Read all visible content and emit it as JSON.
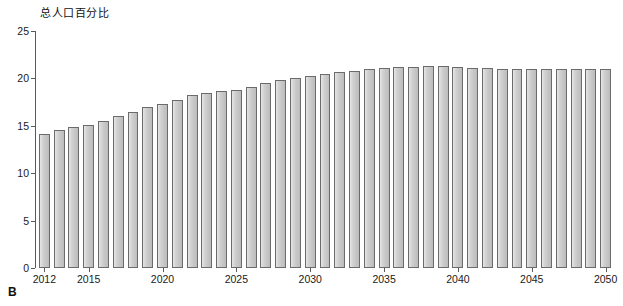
{
  "chart_data": {
    "type": "bar",
    "title": "总人口百分比",
    "panel_label": "B",
    "xlabel": "",
    "ylabel": "",
    "ylim": [
      0,
      25
    ],
    "yticks": [
      0,
      5,
      10,
      15,
      20,
      25
    ],
    "ytick_labels": [
      "0",
      "5",
      "10",
      "15",
      "20",
      "25"
    ],
    "xtick_labels": [
      "2012",
      "2015",
      "2020",
      "2025",
      "2030",
      "2035",
      "2040",
      "2045",
      "2050"
    ],
    "grid": false,
    "legend": "none",
    "bar_color": "#c6c6c6",
    "bar_edge_color": "#6b6b6b",
    "axis_color": "#5a5a5a",
    "categories": [
      "2012",
      "2013",
      "2014",
      "2015",
      "2016",
      "2017",
      "2018",
      "2019",
      "2020",
      "2021",
      "2022",
      "2023",
      "2024",
      "2025",
      "2026",
      "2027",
      "2028",
      "2029",
      "2030",
      "2031",
      "2032",
      "2033",
      "2034",
      "2035",
      "2036",
      "2037",
      "2038",
      "2039",
      "2040",
      "2041",
      "2042",
      "2043",
      "2044",
      "2045",
      "2046",
      "2047",
      "2048",
      "2049",
      "2050"
    ],
    "values": [
      14.1,
      14.6,
      14.9,
      15.1,
      15.5,
      16.0,
      16.5,
      17.0,
      17.3,
      17.7,
      18.2,
      18.5,
      18.7,
      18.8,
      19.1,
      19.5,
      19.8,
      20.0,
      20.3,
      20.5,
      20.7,
      20.8,
      21.0,
      21.1,
      21.2,
      21.2,
      21.3,
      21.3,
      21.2,
      21.1,
      21.1,
      21.0,
      21.0,
      21.0,
      21.0,
      21.0,
      21.0,
      21.0,
      21.0
    ]
  }
}
